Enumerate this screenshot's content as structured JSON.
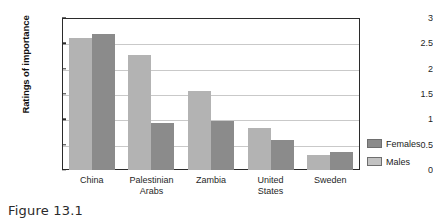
{
  "caption": "Figure 13.1",
  "chart_data": {
    "type": "bar",
    "title": "",
    "xlabel": "",
    "ylabel": "Ratings of importance",
    "ylim": [
      0,
      3
    ],
    "yticks": [
      "0",
      "0.5",
      "1",
      "1.5",
      "2",
      "2.5",
      "3"
    ],
    "ytick_values": [
      0,
      0.5,
      1,
      1.5,
      2,
      2.5,
      3
    ],
    "grid": true,
    "legend_position": "right",
    "categories": [
      "China",
      "Palestinian Arabs",
      "Zambia",
      "United States",
      "Sweden"
    ],
    "category_lines": [
      [
        "China"
      ],
      [
        "Palestinian",
        "Arabs"
      ],
      [
        "Zambia"
      ],
      [
        "United",
        "States"
      ],
      [
        "Sweden"
      ]
    ],
    "series": [
      {
        "name": "Males",
        "color": "#b3b3b3",
        "values": [
          2.6,
          2.27,
          1.55,
          0.83,
          0.29
        ]
      },
      {
        "name": "Females",
        "color": "#8b8b8b",
        "values": [
          2.68,
          0.93,
          0.96,
          0.59,
          0.35
        ]
      }
    ]
  },
  "legend": {
    "items": [
      {
        "label": "Females",
        "color": "#8b8b8b"
      },
      {
        "label": "Males",
        "color": "#c2c2c2"
      }
    ]
  }
}
